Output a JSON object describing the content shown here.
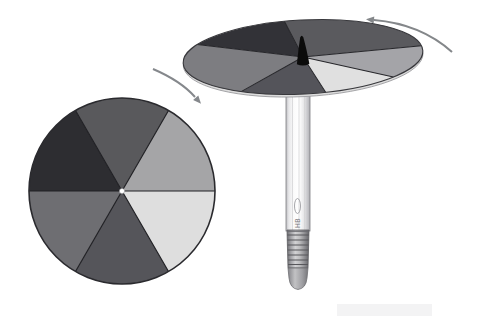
{
  "scene": {
    "background_color": "#ffffff",
    "flat_wheel": {
      "outline_color": "#2a2a2e",
      "divider_color": "#202024",
      "center_dot_color": "#ffffff",
      "sectors": [
        {
          "name": "top",
          "color": "#59595c"
        },
        {
          "name": "upper-left",
          "color": "#2d2d31"
        },
        {
          "name": "lower-left",
          "color": "#6e6e72"
        },
        {
          "name": "bottom",
          "color": "#55555a"
        },
        {
          "name": "lower-right",
          "color": "#dedede"
        },
        {
          "name": "upper-right",
          "color": "#a5a5a7"
        }
      ]
    },
    "spinning_disc": {
      "outline_color": "#38383c",
      "divider_color": "#26262a",
      "rim_edge_color": "#dcdcdc",
      "pencil_tip_color": "#0b0b0b",
      "sectors": [
        {
          "name": "top-right",
          "color": "#5a5a5e"
        },
        {
          "name": "top-left",
          "color": "#323237"
        },
        {
          "name": "west",
          "color": "#7d7d81"
        },
        {
          "name": "bottom",
          "color": "#54545a"
        },
        {
          "name": "lower-right",
          "color": "#e0e0e0"
        },
        {
          "name": "east",
          "color": "#a4a4a8"
        }
      ]
    },
    "pencil": {
      "label": "HB",
      "label_color": "#7a7a7e",
      "logo_outline_color": "#9c9ca0",
      "body_outline_color": "#7e7e82",
      "ferrule_rib_color": "#57575b"
    },
    "arrows": {
      "color": "#85888c",
      "left": {
        "name": "rotation-arrow-left",
        "direction": "curving-down-right"
      },
      "right": {
        "name": "rotation-arrow-right",
        "direction": "curving-up-left"
      }
    }
  }
}
